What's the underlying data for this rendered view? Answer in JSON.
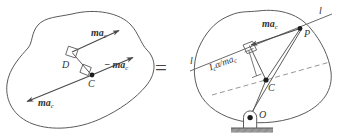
{
  "figure": {
    "type": "engineering-diagram",
    "operator": "=",
    "stroke_color": "#4a4a4a",
    "label_color": "#333333",
    "ground_color": "#8c8c8c",
    "background": "#ffffff"
  },
  "left_diagram": {
    "name": "body-with-offset-force-couple",
    "points": [
      {
        "id": "C",
        "label": "C",
        "x": 92,
        "y": 75
      },
      {
        "id": "D",
        "label": "D",
        "x": 71,
        "y": 60
      }
    ],
    "vectors": [
      {
        "id": "v-top",
        "label": "ma",
        "sub": "c",
        "from": [
          71,
          52
        ],
        "to": [
          118,
          31
        ],
        "desc": "ma_c at D pointing up-right"
      },
      {
        "id": "v-right",
        "label": "− ma",
        "sub": "c",
        "from": [
          92,
          75
        ],
        "to": [
          132,
          58
        ],
        "desc": "minus ma_c at C pointing up-right"
      },
      {
        "id": "v-left",
        "label": "ma",
        "sub": "c",
        "from": [
          92,
          75
        ],
        "to": [
          28,
          101
        ],
        "desc": "ma_c at C pointing down-left"
      }
    ],
    "right_angle_marks": 2,
    "labels": {
      "top_force": "ma",
      "top_force_sub": "c",
      "right_force": "− ma",
      "right_force_sub": "c",
      "left_force": "ma",
      "left_force_sub": "c",
      "point_c": "C",
      "point_d": "D"
    }
  },
  "right_diagram": {
    "name": "body-pinned-at-O-with-resultant-at-P",
    "points": [
      {
        "id": "P",
        "label": "P",
        "x": 300,
        "y": 28
      },
      {
        "id": "C",
        "label": "C",
        "x": 266,
        "y": 80
      },
      {
        "id": "O",
        "label": "O",
        "x": 250,
        "y": 118
      }
    ],
    "lines": [
      {
        "id": "line-l",
        "label": "l",
        "desc": "line of action through P, labelled l at both ends"
      },
      {
        "id": "axis-dashed",
        "label": "",
        "desc": "dashed horizontal-ish axis through C"
      }
    ],
    "vectors": [
      {
        "id": "v-ma",
        "label": "ma",
        "sub": "c",
        "from": [
          300,
          28
        ],
        "to": [
          252,
          44
        ],
        "desc": "ma_c directed down-left along line l"
      }
    ],
    "dimension": {
      "id": "offset-distance",
      "label": "I",
      "sub": "c",
      "label2": "α/ma",
      "sub2": "c",
      "full": "I_cα/ma_c",
      "desc": "perpendicular offset from C to line l"
    },
    "labels": {
      "force": "ma",
      "force_sub": "c",
      "line_left": "l",
      "line_right": "l",
      "point_p": "P",
      "point_c": "C",
      "point_o": "O"
    },
    "support": {
      "name": "pin-support",
      "ground": "hatched-ground-bar"
    }
  }
}
